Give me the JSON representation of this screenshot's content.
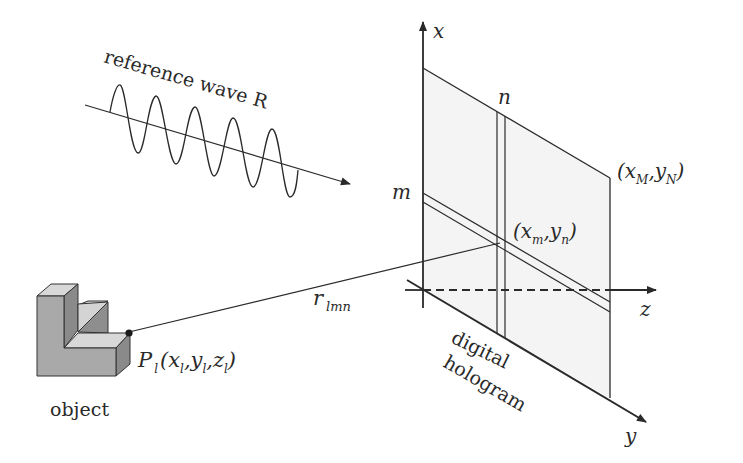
{
  "diagram": {
    "type": "digital hologram geometry",
    "labels": {
      "reference_wave": "reference wave R",
      "axis_x": "x",
      "axis_y": "y",
      "axis_z": "z",
      "index_n": "n",
      "index_m": "m",
      "corner_open": "(x",
      "corner_M": "M",
      "corner_comma": ",y",
      "corner_N": "N",
      "corner_close": ")",
      "pixel_open": "(x",
      "pixel_m": "m",
      "pixel_comma": ",y",
      "pixel_n": "n",
      "pixel_close": ")",
      "distance_r": "r",
      "distance_sub": "lmn",
      "point_P": "P",
      "point_sub": "l",
      "point_coords_1": "(x",
      "point_coords_2": ",y",
      "point_coords_3": ",z",
      "point_coords_4": ")",
      "object": "object",
      "hologram_line1": "digital",
      "hologram_line2": "hologram"
    },
    "colors": {
      "ink": "#2a2a2a",
      "plane_fill": "#f4f4f4",
      "object_front": "#a9a9a9",
      "object_top": "#d8d8d8",
      "object_side": "#8a8a8a"
    }
  }
}
